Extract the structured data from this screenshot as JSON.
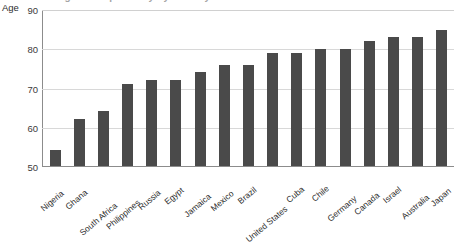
{
  "chart_data": {
    "type": "bar",
    "title": "Average life expectancy by country",
    "xlabel": "",
    "ylabel": "Age",
    "ylim": [
      50,
      90
    ],
    "yticks": [
      50,
      60,
      70,
      80,
      90
    ],
    "grid": true,
    "legend": false,
    "bar_color": "#4a4a4a",
    "categories": [
      "Nigeria",
      "Ghana",
      "South Africa",
      "Philippines",
      "Russia",
      "Egypt",
      "Jamaica",
      "Mexico",
      "Brazil",
      "United States",
      "Cuba",
      "Chile",
      "Germany",
      "Canada",
      "Israel",
      "Australia",
      "Japan"
    ],
    "values": [
      54,
      62,
      64,
      71,
      72,
      72,
      74,
      76,
      76,
      79,
      79,
      80,
      80,
      82,
      83,
      83,
      85
    ]
  }
}
